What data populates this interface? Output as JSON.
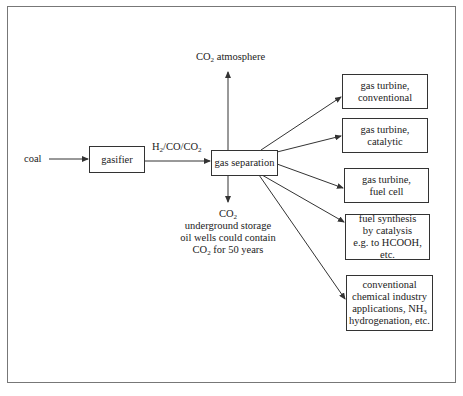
{
  "diagram": {
    "nodes": {
      "coal": {
        "text": "coal"
      },
      "gasifier": {
        "text": "gasifier"
      },
      "gas_separation": {
        "text": "gas separation"
      },
      "co2_atmosphere": {
        "prefix": "CO",
        "sub": "2",
        "suffix": " atmosphere"
      },
      "co2_storage": {
        "line1_prefix": "CO",
        "line1_sub": "2",
        "line2": "underground storage",
        "line3": "oil wells could contain",
        "line4_prefix": "CO",
        "line4_sub": "2",
        "line4_suffix": " for 50 years"
      },
      "gt_conventional": {
        "line1": "gas turbine,",
        "line2": "conventional"
      },
      "gt_catalytic": {
        "line1": "gas turbine,",
        "line2": "catalytic"
      },
      "gt_fuel_cell": {
        "line1": "gas turbine,",
        "line2": "fuel cell"
      },
      "fuel_synthesis": {
        "line1": "fuel synthesis",
        "line2": "by catalysis",
        "line3": "e.g. to HCOOH, etc."
      },
      "chemical_industry": {
        "line1": "conventional",
        "line2": "chemical industry",
        "line3_prefix": "applications, NH",
        "line3_sub": "3",
        "line4": "hydrogenation, etc."
      }
    },
    "edges": {
      "syngas_label": {
        "p1": "H",
        "s1": "2",
        "p2": "/CO/CO",
        "s2": "2"
      }
    },
    "colors": {
      "line": "#333333",
      "frame": "#777777"
    }
  }
}
